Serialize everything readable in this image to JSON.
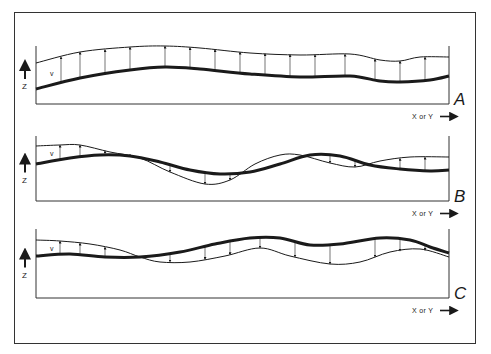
{
  "figure": {
    "panels": [
      {
        "id": "A",
        "label": "A",
        "axis_x_label": "X or Y",
        "axis_z_label": "Z",
        "vector_label": "v",
        "frame": {
          "left": 36,
          "right": 449,
          "top": 46,
          "baseline": 104
        },
        "thick_surface": [
          [
            36,
            89
          ],
          [
            80,
            78
          ],
          [
            130,
            70
          ],
          [
            165,
            67
          ],
          [
            200,
            69
          ],
          [
            250,
            74
          ],
          [
            300,
            77
          ],
          [
            350,
            76
          ],
          [
            380,
            81
          ],
          [
            400,
            82
          ],
          [
            430,
            80
          ],
          [
            449,
            76
          ]
        ],
        "thin_surface": [
          [
            36,
            63
          ],
          [
            80,
            52
          ],
          [
            130,
            47
          ],
          [
            165,
            46
          ],
          [
            200,
            48
          ],
          [
            250,
            53
          ],
          [
            300,
            55
          ],
          [
            350,
            54
          ],
          [
            380,
            60
          ],
          [
            400,
            61
          ],
          [
            420,
            57
          ],
          [
            449,
            57
          ]
        ],
        "arrows_x": [
          61,
          80,
          105,
          130,
          165,
          190,
          215,
          240,
          265,
          290,
          315,
          345,
          375,
          400,
          425
        ]
      },
      {
        "id": "B",
        "label": "B",
        "axis_x_label": "X or Y",
        "axis_z_label": "Z",
        "vector_label": "v",
        "frame": {
          "left": 36,
          "right": 449,
          "top": 136,
          "baseline": 201
        },
        "thick_surface": [
          [
            36,
            164
          ],
          [
            70,
            158
          ],
          [
            100,
            155
          ],
          [
            130,
            156
          ],
          [
            160,
            162
          ],
          [
            190,
            170
          ],
          [
            220,
            174
          ],
          [
            250,
            172
          ],
          [
            280,
            164
          ],
          [
            310,
            155
          ],
          [
            340,
            156
          ],
          [
            370,
            165
          ],
          [
            400,
            169
          ],
          [
            430,
            171
          ],
          [
            449,
            170
          ]
        ],
        "thin_surface": [
          [
            36,
            146
          ],
          [
            60,
            145
          ],
          [
            80,
            145
          ],
          [
            110,
            152
          ],
          [
            140,
            158
          ],
          [
            170,
            172
          ],
          [
            205,
            184
          ],
          [
            230,
            180
          ],
          [
            255,
            164
          ],
          [
            280,
            155
          ],
          [
            300,
            155
          ],
          [
            330,
            163
          ],
          [
            355,
            167
          ],
          [
            380,
            161
          ],
          [
            410,
            157
          ],
          [
            449,
            157
          ]
        ],
        "arrows_x": [
          60,
          80,
          105,
          130,
          170,
          205,
          230,
          330,
          355,
          400,
          425
        ]
      },
      {
        "id": "C",
        "label": "C",
        "axis_x_label": "X or Y",
        "axis_z_label": "Z",
        "vector_label": "v",
        "frame": {
          "left": 36,
          "right": 449,
          "top": 229,
          "baseline": 298
        },
        "thick_surface": [
          [
            36,
            256
          ],
          [
            70,
            254
          ],
          [
            105,
            257
          ],
          [
            140,
            257
          ],
          [
            180,
            252
          ],
          [
            215,
            244
          ],
          [
            250,
            238
          ],
          [
            280,
            238
          ],
          [
            310,
            245
          ],
          [
            340,
            244
          ],
          [
            380,
            238
          ],
          [
            410,
            240
          ],
          [
            430,
            247
          ],
          [
            449,
            253
          ]
        ],
        "thin_surface": [
          [
            36,
            240
          ],
          [
            60,
            241
          ],
          [
            90,
            244
          ],
          [
            120,
            250
          ],
          [
            140,
            257
          ],
          [
            160,
            262
          ],
          [
            190,
            262
          ],
          [
            225,
            256
          ],
          [
            260,
            248
          ],
          [
            290,
            256
          ],
          [
            330,
            264
          ],
          [
            360,
            262
          ],
          [
            390,
            252
          ],
          [
            420,
            249
          ],
          [
            449,
            257
          ]
        ],
        "arrows_x": [
          60,
          80,
          105,
          170,
          205,
          230,
          260,
          295,
          330,
          375,
          400,
          425
        ]
      }
    ],
    "colors": {
      "ink": "#1a1a1a",
      "frame": "#333333",
      "background": "#ffffff"
    }
  }
}
